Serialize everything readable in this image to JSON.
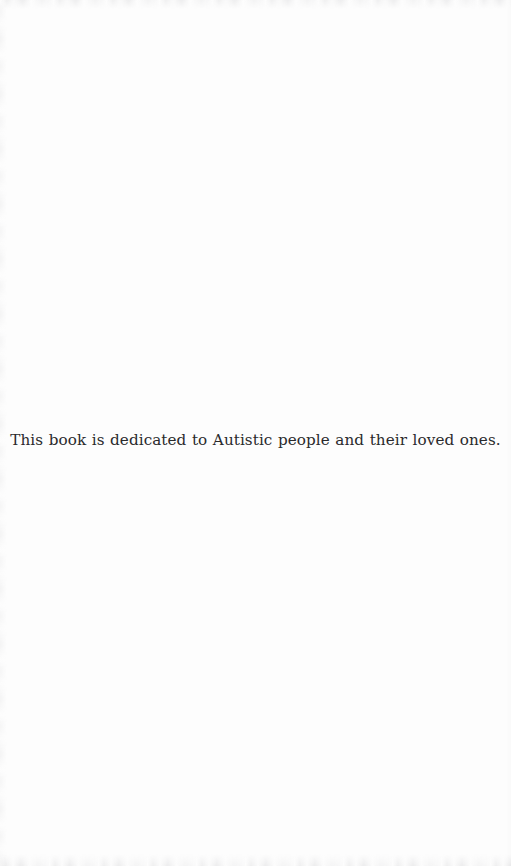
{
  "page": {
    "kind": "book-dedication-page",
    "background_color": "#fdfdfd",
    "text_color": "#2a2a2c"
  },
  "dedication": {
    "text": "This book is dedicated to Autistic people and their loved ones."
  }
}
